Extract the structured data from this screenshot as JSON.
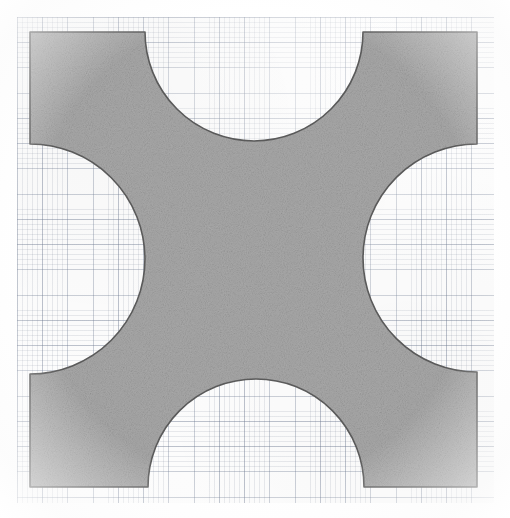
{
  "document": {
    "title": "Square with four semicircular notches on graph paper",
    "media": "scanned graph paper sheet",
    "caption": "Shaded square region with four concave semicircular cut-outs centred on each edge"
  },
  "colors": {
    "page_background": "#ffffff",
    "paper_background": "#fdfdfd",
    "grid_minor": "#78829620",
    "grid_major": "#69768a57",
    "shape_fill": "#b5b5b5",
    "shape_fill_light": "#c2c2c2",
    "shape_fill_dark": "#a9a9a9",
    "shape_stroke": "#5a5a5a"
  },
  "paper": {
    "left": 17,
    "top": 17,
    "width": 477,
    "height": 486,
    "minor_cell_px": 5.05,
    "major_cell_px": 25.25,
    "minor_per_major": 5
  },
  "figure": {
    "type": "notched-square",
    "label": "square-with-four-semicircular-notches",
    "square": {
      "left": 30,
      "top": 32,
      "right": 477,
      "bottom": 487,
      "width": 447,
      "height": 455
    },
    "notches": [
      {
        "name": "top-notch",
        "edge": "top",
        "center_x": 254,
        "center_y": 32,
        "radius": 109,
        "chord_start_x": 145,
        "chord_end_x": 363,
        "apex_y": 150,
        "orientation": "concave-downward"
      },
      {
        "name": "right-notch",
        "edge": "right",
        "center_x": 477,
        "center_y": 258,
        "radius": 114,
        "chord_start_y": 144,
        "chord_end_y": 372,
        "apex_x": 364,
        "orientation": "concave-leftward"
      },
      {
        "name": "bottom-notch",
        "edge": "bottom",
        "center_x": 256,
        "center_y": 487,
        "radius": 108,
        "chord_start_x": 148,
        "chord_end_x": 364,
        "apex_y": 374,
        "orientation": "concave-upward"
      },
      {
        "name": "left-notch",
        "edge": "left",
        "center_x": 30,
        "center_y": 259,
        "radius": 115,
        "chord_start_y": 144,
        "chord_end_y": 374,
        "apex_x": 155,
        "orientation": "concave-rightward"
      }
    ],
    "stroke_width": 1.6,
    "fill_texture": "speckled / noisy pencil shading"
  }
}
